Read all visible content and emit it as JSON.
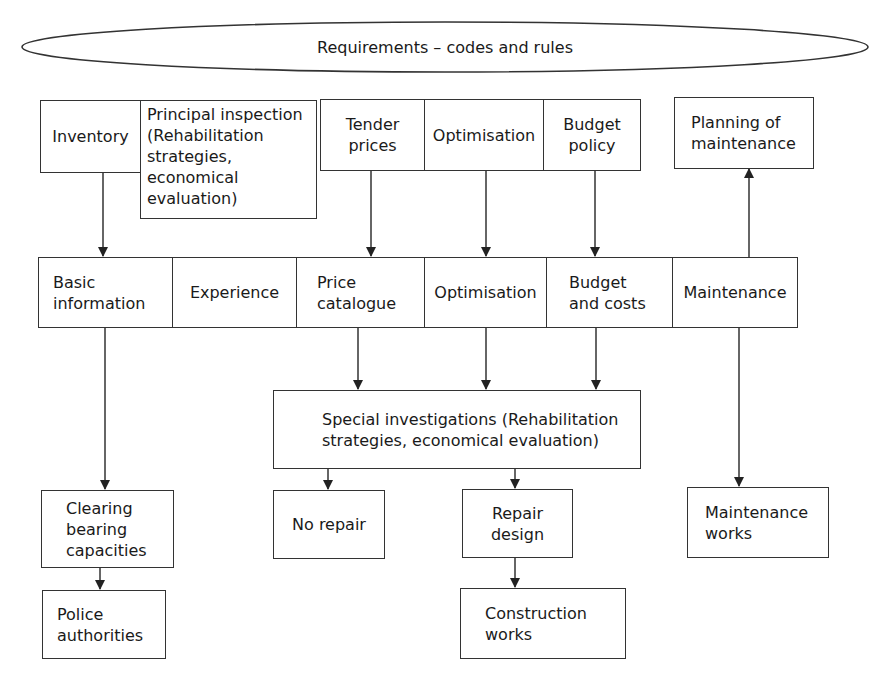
{
  "diagram": {
    "header": {
      "label": "Requirements – codes and rules"
    },
    "top_row": {
      "inventory": "Inventory",
      "principal_inspection": "Principal inspection\n(Rehabilitation\nstrategies,\neconomical\nevaluation)",
      "tender_prices": "Tender\nprices",
      "optimisation": "Optimisation",
      "budget_policy": "Budget\npolicy",
      "planning_of_maintenance": "Planning of\nmaintenance"
    },
    "middle_row": {
      "basic_information": "Basic\ninformation",
      "experience": "Experience",
      "price_catalogue": "Price\ncatalogue",
      "optimisation": "Optimisation",
      "budget_and_costs": "Budget\nand costs",
      "maintenance": "Maintenance"
    },
    "special_investigations": "Special investigations (Rehabilitation\nstrategies, economical evaluation)",
    "outcomes": {
      "clearing_bearing_capacities": "Clearing\nbearing\ncapacities",
      "police_authorities": "Police\nauthorities",
      "no_repair": "No repair",
      "repair_design": "Repair\ndesign",
      "construction_works": "Construction\nworks",
      "maintenance_works": "Maintenance\nworks"
    },
    "edges": [
      [
        "Inventory",
        "Basic information"
      ],
      [
        "Tender prices",
        "Price catalogue"
      ],
      [
        "Optimisation",
        "Optimisation"
      ],
      [
        "Budget policy",
        "Budget and costs"
      ],
      [
        "Maintenance",
        "Planning of maintenance"
      ],
      [
        "Price catalogue",
        "Special investigations"
      ],
      [
        "Optimisation",
        "Special investigations"
      ],
      [
        "Budget and costs",
        "Special investigations"
      ],
      [
        "Basic information",
        "Clearing bearing capacities"
      ],
      [
        "Clearing bearing capacities",
        "Police authorities"
      ],
      [
        "Special investigations",
        "No repair"
      ],
      [
        "Special investigations",
        "Repair design"
      ],
      [
        "Repair design",
        "Construction works"
      ],
      [
        "Maintenance",
        "Maintenance works"
      ]
    ],
    "colors": {
      "line": "#333333",
      "background": "#ffffff",
      "text": "#1a1a1a"
    }
  }
}
